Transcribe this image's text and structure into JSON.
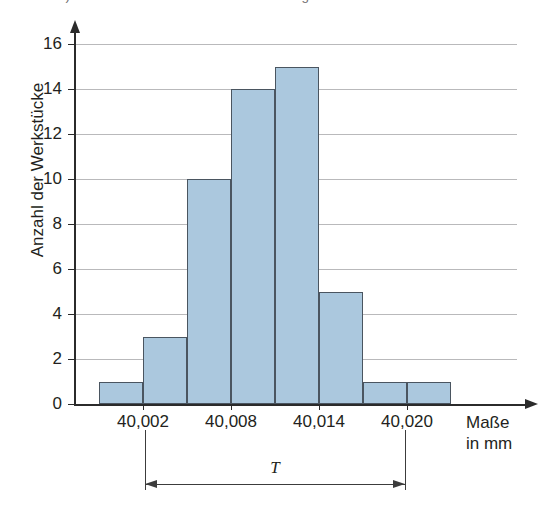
{
  "heading": {
    "text": "b) Welche Informationen liefert das Histogramm?"
  },
  "chart_data": {
    "type": "bar",
    "title": "",
    "xlabel": "Maße in mm",
    "xlabel_line1": "Maße",
    "xlabel_line2": "in mm",
    "ylabel": "Anzahl der Werkstücke",
    "categories": [
      "40,000",
      "40,002",
      "40,004",
      "40,006",
      "40,008",
      "40,010",
      "40,012",
      "40,014"
    ],
    "values": [
      1,
      3,
      10,
      14,
      15,
      5,
      1,
      1
    ],
    "ylim": [
      0,
      16
    ],
    "ytick_labels": [
      "0",
      "2",
      "4",
      "6",
      "8",
      "10",
      "12",
      "14",
      "16"
    ],
    "ytick_values": [
      0,
      2,
      4,
      6,
      8,
      10,
      12,
      14,
      16
    ],
    "xtick_labels": [
      "40,002",
      "40,008",
      "40,014",
      "40,020"
    ],
    "xtick_values": [
      40.002,
      40.008,
      40.014,
      40.02
    ],
    "grid": true,
    "legend": "none",
    "bar_fill_color": "#abc8de",
    "bar_edge_color": "#4a5560",
    "grid_color": "#b9b9bb",
    "axis_color": "#2b2b2b",
    "annotations": [
      {
        "name": "tolerance",
        "label": "T",
        "from": "40,002",
        "to": "40,020"
      }
    ]
  }
}
